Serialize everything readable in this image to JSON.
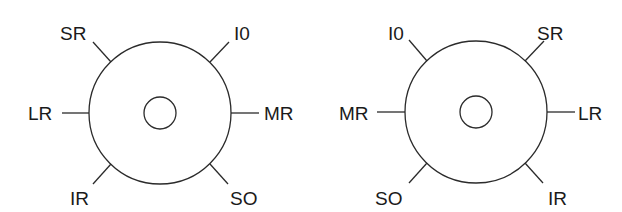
{
  "diagrams": [
    {
      "name": "left-eye-diagram",
      "labels": {
        "superior_left": "SR",
        "superior_right": "I0",
        "lateral_left": "LR",
        "lateral_right": "MR",
        "inferior_left": "IR",
        "inferior_right": "SO"
      }
    },
    {
      "name": "right-eye-diagram",
      "labels": {
        "superior_left": "I0",
        "superior_right": "SR",
        "lateral_left": "MR",
        "lateral_right": "LR",
        "inferior_left": "SO",
        "inferior_right": "IR"
      }
    }
  ],
  "colors": {
    "line": "#2b2b2b",
    "text": "#1a1a1a",
    "background": "#ffffff"
  }
}
